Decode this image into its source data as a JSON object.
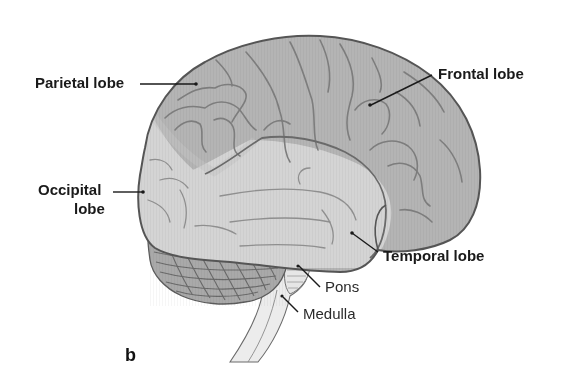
{
  "diagram": {
    "panel_label": "b",
    "colors": {
      "background": "#ffffff",
      "frontal_parietal_fill": "#b4b4b4",
      "temporal_occipital_fill": "#d4d4d4",
      "cerebellum_fill": "#a9a9a9",
      "brainstem_fill": "#ececec",
      "outline": "#555555",
      "label_text": "#1a1a1a"
    },
    "labels": {
      "parietal": "Parietal lobe",
      "frontal": "Frontal lobe",
      "occipital_line1": "Occipital",
      "occipital_line2": "lobe",
      "temporal": "Temporal lobe",
      "pons": "Pons",
      "medulla": "Medulla"
    }
  }
}
